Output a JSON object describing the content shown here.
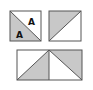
{
  "diagram": {
    "colors": {
      "stroke": "#555555",
      "shade": "#c8c8c8",
      "background": "#ffffff"
    },
    "square1": {
      "labels": [
        "A",
        "A"
      ]
    },
    "square2": {},
    "rectangle": {}
  }
}
